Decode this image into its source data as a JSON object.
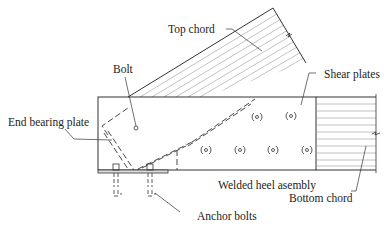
{
  "diagram": {
    "labels": {
      "top_chord": "Top chord",
      "bolt": "Bolt",
      "shear_plates": "Shear plates",
      "end_bearing_plate": "End bearing plate",
      "welded_heel_assembly": "Welded heel asembly",
      "bottom_chord": "Bottom chord",
      "anchor_bolts": "Anchor bolts"
    },
    "components": [
      "Top chord",
      "Bottom chord",
      "End bearing plate",
      "Bolt",
      "Shear plates",
      "Anchor bolts",
      "Welded heel assembly"
    ],
    "shear_plate_count": 6,
    "anchor_bolt_count": 2,
    "colors": {
      "line": "#333333",
      "hatch": "#888888",
      "background": "#ffffff"
    }
  }
}
